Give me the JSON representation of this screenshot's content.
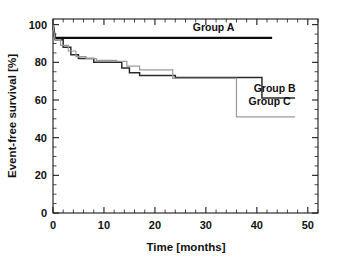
{
  "chart_data": {
    "type": "line",
    "subtype": "kaplan-meier-step",
    "title": "",
    "xlabel": "Time [months]",
    "ylabel": "Event-free survival [%]",
    "xlim": [
      0,
      52
    ],
    "ylim": [
      0,
      103
    ],
    "xticks": [
      0,
      10,
      20,
      30,
      40,
      50
    ],
    "yticks": [
      0,
      20,
      40,
      60,
      80,
      100
    ],
    "xtick_labels": [
      "0",
      "10",
      "20",
      "30",
      "40",
      "50"
    ],
    "ytick_labels": [
      "0",
      "20",
      "40",
      "60",
      "80",
      "100"
    ],
    "x_minor_tick_interval": 2,
    "y_minor_tick_interval": 5,
    "grid": false,
    "legend_position": "inline-right",
    "colors": {
      "group_a": "#0d0d0d",
      "group_b": "#2b2b2b",
      "group_c": "#9a9a9a",
      "axis": "#1a1a1a",
      "background": "#ffffff"
    },
    "series": [
      {
        "name": "Group A",
        "label": "Group A",
        "color": "#0d0d0d",
        "label_x": 31.5,
        "label_y": 96.5,
        "steps": [
          [
            0,
            100
          ],
          [
            0.4,
            93
          ],
          [
            43,
            93
          ]
        ]
      },
      {
        "name": "Group B",
        "label": "Group B",
        "color": "#2b2b2b",
        "label_x": 43.5,
        "label_y": 64.5,
        "steps": [
          [
            0,
            100
          ],
          [
            0.4,
            92
          ],
          [
            2,
            92
          ],
          [
            2,
            88
          ],
          [
            3.5,
            88
          ],
          [
            3.5,
            84
          ],
          [
            5,
            84
          ],
          [
            5,
            82
          ],
          [
            8,
            82
          ],
          [
            8,
            80
          ],
          [
            13.5,
            80
          ],
          [
            13.5,
            77
          ],
          [
            15,
            77
          ],
          [
            15,
            74.5
          ],
          [
            17,
            74.5
          ],
          [
            17,
            73
          ],
          [
            24,
            73
          ],
          [
            24,
            72
          ],
          [
            41,
            72
          ],
          [
            41,
            61
          ],
          [
            47.5,
            61
          ]
        ]
      },
      {
        "name": "Group C",
        "label": "Group C",
        "color": "#9a9a9a",
        "label_x": 42.5,
        "label_y": 57.5,
        "steps": [
          [
            0,
            100
          ],
          [
            0.4,
            92
          ],
          [
            1.5,
            92
          ],
          [
            1.5,
            89
          ],
          [
            3,
            89
          ],
          [
            3,
            86
          ],
          [
            4.5,
            86
          ],
          [
            4.5,
            83
          ],
          [
            6.5,
            83
          ],
          [
            6.5,
            82
          ],
          [
            8.5,
            82
          ],
          [
            8.5,
            81
          ],
          [
            12.5,
            81
          ],
          [
            12.5,
            80.5
          ],
          [
            14.5,
            80.5
          ],
          [
            14.5,
            78
          ],
          [
            17,
            78
          ],
          [
            17,
            76
          ],
          [
            23.5,
            76
          ],
          [
            23.5,
            71.5
          ],
          [
            36,
            71.5
          ],
          [
            36,
            51
          ],
          [
            47.5,
            51
          ]
        ]
      }
    ]
  },
  "caption": {
    "clipped_text": "",
    "visible": true
  }
}
